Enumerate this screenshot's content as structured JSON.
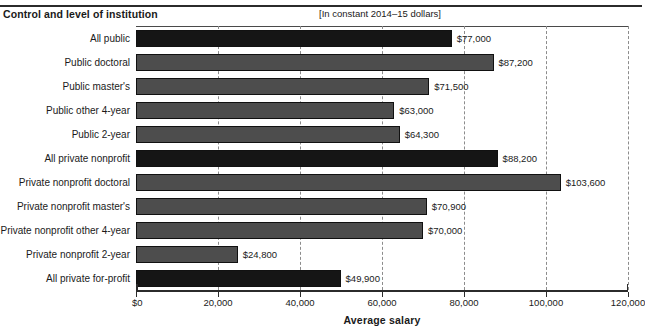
{
  "header": {
    "left_title": "Control and level of institution",
    "units_note": "[In constant 2014–15 dollars]"
  },
  "chart_data": {
    "type": "bar",
    "orientation": "horizontal",
    "title": "Control and level of institution",
    "subtitle": "[In constant 2014–15 dollars]",
    "xlabel": "Average salary",
    "ylabel": "",
    "xlim": [
      0,
      120000
    ],
    "grid": true,
    "legend": "none",
    "tick_labels": [
      "$0",
      "20,000",
      "40,000",
      "60,000",
      "80,000",
      "100,000",
      "120,000"
    ],
    "tick_values": [
      0,
      20000,
      40000,
      60000,
      80000,
      100000,
      120000
    ],
    "categories": [
      "All public",
      "Public doctoral",
      "Public master's",
      "Public other 4-year",
      "Public 2-year",
      "All private nonprofit",
      "Private nonprofit doctoral",
      "Private nonprofit master's",
      "Private nonprofit other 4-year",
      "Private nonprofit 2-year",
      "All private for-profit"
    ],
    "values": [
      77000,
      87200,
      71500,
      63000,
      64300,
      88200,
      103600,
      70900,
      70000,
      24800,
      49900
    ],
    "value_labels": [
      "$77,000",
      "$87,200",
      "$71,500",
      "$63,000",
      "$64,300",
      "$88,200",
      "$103,600",
      "$70,900",
      "$70,000",
      "$24,800",
      "$49,900"
    ],
    "bar_shades": [
      "dark",
      "mid",
      "mid",
      "mid",
      "mid",
      "dark",
      "mid",
      "mid",
      "mid",
      "mid",
      "dark"
    ],
    "colors": {
      "dark": "#151515",
      "mid": "#4d4d4d",
      "axis": "#2b2b2b",
      "grid": "#8c8c8c"
    }
  },
  "axis": {
    "title": "Average salary"
  }
}
